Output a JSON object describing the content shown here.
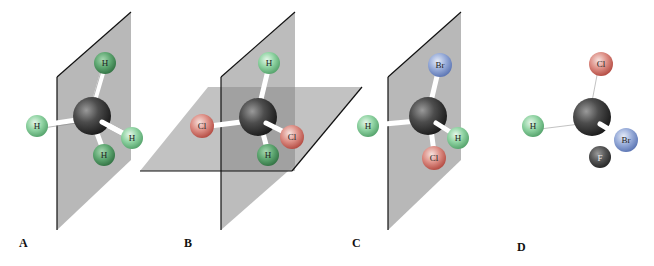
{
  "figure": {
    "panels": [
      {
        "label": "A",
        "atoms": [
          "H",
          "H",
          "H",
          "H"
        ],
        "center": "C",
        "planes": 1
      },
      {
        "label": "B",
        "atoms": [
          "Cl",
          "H",
          "Cl",
          "H"
        ],
        "center": "C",
        "planes": 2
      },
      {
        "label": "C",
        "atoms": [
          "H",
          "Br",
          "H",
          "Cl"
        ],
        "center": "C",
        "planes": 1
      },
      {
        "label": "D",
        "atoms": [
          "Cl",
          "H",
          "Br",
          "F"
        ],
        "center": "C",
        "planes": 0
      }
    ],
    "colors": {
      "H": "#7fcf95",
      "Cl": "#d9807a",
      "Br": "#8fa6d8",
      "F": "#555555",
      "C": "#4a4a4a",
      "plane": "#b3b3b3",
      "plane_edge": "#111111"
    }
  }
}
